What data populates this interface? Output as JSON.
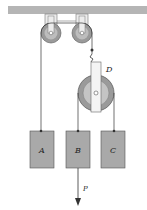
{
  "diagram": {
    "type": "pulley-system",
    "colors": {
      "ceiling": "#b5b5b5",
      "block": "#a9a9a9",
      "pulley_outer": "#9a9a9a",
      "pulley_inner": "#c4c4c4",
      "rope": "#333333"
    },
    "pulleys": [
      {
        "id": "fixed-left"
      },
      {
        "id": "fixed-right"
      },
      {
        "id": "D",
        "label": "D"
      }
    ],
    "blocks": [
      {
        "id": "A",
        "label": "A"
      },
      {
        "id": "B",
        "label": "B"
      },
      {
        "id": "C",
        "label": "C"
      }
    ],
    "force": {
      "label": "P",
      "direction": "down"
    }
  }
}
